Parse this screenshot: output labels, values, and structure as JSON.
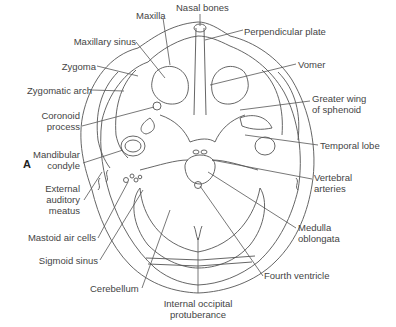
{
  "figure": {
    "panel_label": "A"
  },
  "labels": {
    "nasal_bones": "Nasal bones",
    "maxilla": "Maxilla",
    "perpendicular_plate": "Perpendicular plate",
    "maxillary_sinus": "Maxillary sinus",
    "vomer": "Vomer",
    "zygoma": "Zygoma",
    "zygomatic_arch": "Zygomatic arch",
    "greater_wing_l1": "Greater wing",
    "greater_wing_l2": "of sphenoid",
    "coronoid_l1": "Coronoid",
    "coronoid_l2": "process",
    "temporal_lobe": "Temporal lobe",
    "mandibular_l1": "Mandibular",
    "mandibular_l2": "condyle",
    "vertebral_l1": "Vertebral",
    "vertebral_l2": "arteries",
    "ext_aud_l1": "External",
    "ext_aud_l2": "auditory",
    "ext_aud_l3": "meatus",
    "medulla_l1": "Medulla",
    "medulla_l2": "oblongata",
    "mastoid_air_cells": "Mastoid air cells",
    "sigmoid_sinus": "Sigmoid sinus",
    "fourth_ventricle": "Fourth ventricle",
    "cerebellum": "Cerebellum",
    "int_occ_l1": "Internal occipital",
    "int_occ_l2": "protuberance"
  }
}
